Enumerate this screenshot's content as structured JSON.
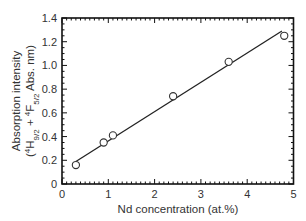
{
  "chart_data": {
    "type": "scatter",
    "title": "",
    "xlabel": "Nd concentration (at.%)",
    "ylabel_line1": "Absorption intensity",
    "ylabel_line2_parts": [
      "(",
      "4",
      "H",
      "9/2",
      " + ",
      "4",
      "F",
      "5/2",
      " Abs. nm)"
    ],
    "ylabel": "Absorption intensity (4H9/2 + 4F5/2 Abs. nm)",
    "xlim": [
      0,
      5
    ],
    "ylim": [
      0,
      1.4
    ],
    "x_ticks": [
      "0",
      "1",
      "2",
      "3",
      "4",
      "5"
    ],
    "y_ticks": [
      "0",
      "0.2",
      "0.4",
      "0.6",
      "0.8",
      "1.0",
      "1.2",
      "1.4"
    ],
    "grid": false,
    "legend": null,
    "series": [
      {
        "name": "measured",
        "marker": "open-circle",
        "x": [
          0.3,
          0.9,
          1.1,
          2.4,
          3.6,
          4.8
        ],
        "y": [
          0.16,
          0.35,
          0.41,
          0.74,
          1.03,
          1.25
        ]
      },
      {
        "name": "linear fit",
        "marker": "line",
        "x": [
          0.3,
          4.75
        ],
        "y": [
          0.19,
          1.29
        ]
      }
    ]
  }
}
